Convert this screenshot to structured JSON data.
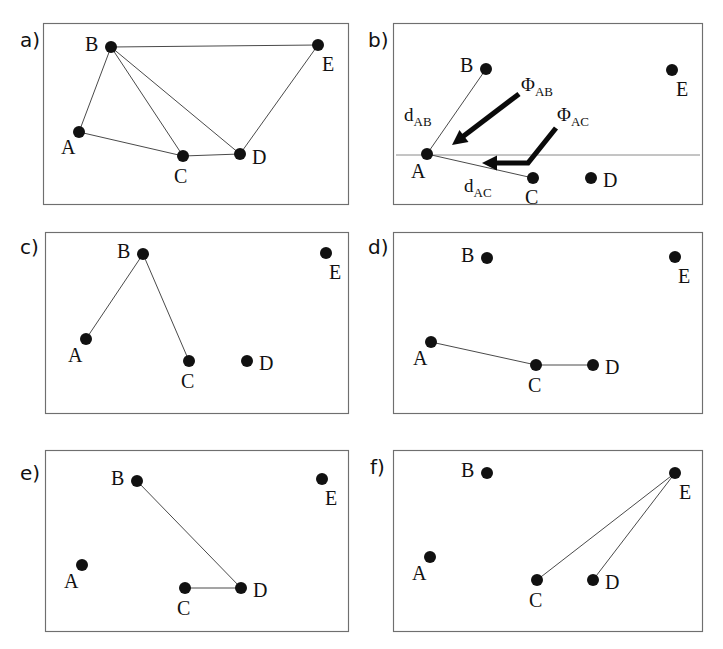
{
  "figure": {
    "type": "diagram",
    "background_color": "#ffffff",
    "node_color": "#111111",
    "edge_color": "#4a4a4a",
    "border_color": "#6f6f6f",
    "node_radius": 6.0,
    "panels": [
      {
        "id": "a",
        "letter": "a)",
        "letter_pos": {
          "x": 20,
          "y": 47
        },
        "box": {
          "x": 43,
          "y": 23,
          "w": 305,
          "h": 181
        },
        "nodes": [
          {
            "id": "A",
            "x": 79,
            "y": 132,
            "label_dx": -18,
            "label_dy": 22
          },
          {
            "id": "B",
            "x": 111,
            "y": 47,
            "label_dx": -26,
            "label_dy": 4
          },
          {
            "id": "C",
            "x": 183,
            "y": 156,
            "label_dx": -9,
            "label_dy": 27
          },
          {
            "id": "D",
            "x": 240,
            "y": 154,
            "label_dx": 12,
            "label_dy": 10
          },
          {
            "id": "E",
            "x": 318,
            "y": 45,
            "label_dx": 4,
            "label_dy": 26
          }
        ],
        "edges": [
          [
            "A",
            "B"
          ],
          [
            "A",
            "C"
          ],
          [
            "B",
            "C"
          ],
          [
            "B",
            "D"
          ],
          [
            "B",
            "E"
          ],
          [
            "C",
            "D"
          ],
          [
            "D",
            "E"
          ]
        ],
        "reference_line": null,
        "annotations": []
      },
      {
        "id": "b",
        "letter": "b)",
        "letter_pos": {
          "x": 368,
          "y": 47
        },
        "box": {
          "x": 393,
          "y": 23,
          "w": 309,
          "h": 181
        },
        "nodes": [
          {
            "id": "A",
            "x": 427,
            "y": 154,
            "label_dx": -16,
            "label_dy": 24
          },
          {
            "id": "B",
            "x": 486,
            "y": 69,
            "label_dx": -26,
            "label_dy": 3
          },
          {
            "id": "C",
            "x": 533,
            "y": 178,
            "label_dx": -8,
            "label_dy": 26
          },
          {
            "id": "D",
            "x": 591,
            "y": 178,
            "label_dx": 12,
            "label_dy": 9
          },
          {
            "id": "E",
            "x": 672,
            "y": 70,
            "label_dx": 4,
            "label_dy": 26
          }
        ],
        "edges": [
          [
            "A",
            "B"
          ],
          [
            "A",
            "C"
          ]
        ],
        "reference_line": {
          "x1": 396,
          "y1": 155,
          "x2": 700,
          "y2": 155
        },
        "annotations": [
          {
            "name": "distance-ab",
            "text": "d",
            "sub": "AB",
            "x": 404,
            "y": 121
          },
          {
            "name": "distance-ac",
            "text": "d",
            "sub": "AC",
            "x": 464,
            "y": 192
          },
          {
            "name": "angle-ab",
            "text": "Φ",
            "sub": "AB",
            "x": 521,
            "y": 91
          },
          {
            "name": "angle-ac",
            "text": "Φ",
            "sub": "AC",
            "x": 557,
            "y": 121
          }
        ],
        "arrows": [
          {
            "name": "angle-ab-arrow",
            "path": "M 519,94 L 461,138",
            "head": {
              "x": 452,
              "y": 145,
              "angle": 143
            }
          },
          {
            "name": "angle-ac-arrow",
            "path": "M 556,128 L 528,163 L 491,163",
            "head": {
              "x": 482,
              "y": 163,
              "angle": 180
            }
          }
        ]
      },
      {
        "id": "c",
        "letter": "c)",
        "letter_pos": {
          "x": 20,
          "y": 254
        },
        "box": {
          "x": 45,
          "y": 232,
          "w": 303,
          "h": 181
        },
        "nodes": [
          {
            "id": "A",
            "x": 86,
            "y": 339,
            "label_dx": -18,
            "label_dy": 23
          },
          {
            "id": "B",
            "x": 143,
            "y": 254,
            "label_dx": -26,
            "label_dy": 4
          },
          {
            "id": "C",
            "x": 189,
            "y": 361,
            "label_dx": -8,
            "label_dy": 27
          },
          {
            "id": "D",
            "x": 247,
            "y": 361,
            "label_dx": 12,
            "label_dy": 9
          },
          {
            "id": "E",
            "x": 326,
            "y": 253,
            "label_dx": 3,
            "label_dy": 26
          }
        ],
        "edges": [
          [
            "A",
            "B"
          ],
          [
            "B",
            "C"
          ]
        ],
        "reference_line": null,
        "annotations": []
      },
      {
        "id": "d",
        "letter": "d)",
        "letter_pos": {
          "x": 368,
          "y": 254
        },
        "box": {
          "x": 393,
          "y": 232,
          "w": 309,
          "h": 181
        },
        "nodes": [
          {
            "id": "A",
            "x": 431,
            "y": 342,
            "label_dx": -18,
            "label_dy": 23
          },
          {
            "id": "B",
            "x": 487,
            "y": 258,
            "label_dx": -26,
            "label_dy": 4
          },
          {
            "id": "C",
            "x": 536,
            "y": 365,
            "label_dx": -8,
            "label_dy": 27
          },
          {
            "id": "D",
            "x": 593,
            "y": 365,
            "label_dx": 12,
            "label_dy": 9
          },
          {
            "id": "E",
            "x": 675,
            "y": 257,
            "label_dx": 3,
            "label_dy": 26
          }
        ],
        "edges": [
          [
            "A",
            "C"
          ],
          [
            "C",
            "D"
          ]
        ],
        "reference_line": null,
        "annotations": []
      },
      {
        "id": "e",
        "letter": "e)",
        "letter_pos": {
          "x": 20,
          "y": 480
        },
        "box": {
          "x": 45,
          "y": 450,
          "w": 303,
          "h": 181
        },
        "nodes": [
          {
            "id": "A",
            "x": 82,
            "y": 565,
            "label_dx": -18,
            "label_dy": 23
          },
          {
            "id": "B",
            "x": 137,
            "y": 481,
            "label_dx": -26,
            "label_dy": 4
          },
          {
            "id": "C",
            "x": 185,
            "y": 588,
            "label_dx": -8,
            "label_dy": 27
          },
          {
            "id": "D",
            "x": 241,
            "y": 588,
            "label_dx": 12,
            "label_dy": 9
          },
          {
            "id": "E",
            "x": 322,
            "y": 479,
            "label_dx": 3,
            "label_dy": 26
          }
        ],
        "edges": [
          [
            "B",
            "D"
          ],
          [
            "C",
            "D"
          ]
        ],
        "reference_line": null,
        "annotations": []
      },
      {
        "id": "f",
        "letter": "f)",
        "letter_pos": {
          "x": 370,
          "y": 474
        },
        "box": {
          "x": 393,
          "y": 450,
          "w": 309,
          "h": 181
        },
        "nodes": [
          {
            "id": "A",
            "x": 430,
            "y": 557,
            "label_dx": -18,
            "label_dy": 23
          },
          {
            "id": "B",
            "x": 487,
            "y": 473,
            "label_dx": -26,
            "label_dy": 4
          },
          {
            "id": "C",
            "x": 537,
            "y": 580,
            "label_dx": -8,
            "label_dy": 27
          },
          {
            "id": "D",
            "x": 593,
            "y": 580,
            "label_dx": 12,
            "label_dy": 9
          },
          {
            "id": "E",
            "x": 675,
            "y": 473,
            "label_dx": 4,
            "label_dy": 26
          }
        ],
        "edges": [
          [
            "C",
            "E"
          ],
          [
            "D",
            "E"
          ]
        ],
        "reference_line": null,
        "annotations": []
      }
    ]
  }
}
